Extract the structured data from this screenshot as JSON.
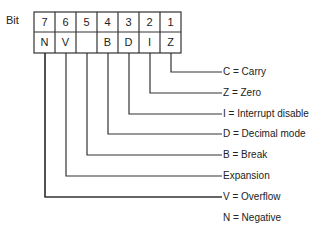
{
  "header": {
    "bit_label": "Bit"
  },
  "register": {
    "bit_numbers": [
      "7",
      "6",
      "5",
      "4",
      "3",
      "2",
      "1",
      "0"
    ],
    "flags": [
      "N",
      "V",
      "",
      "B",
      "D",
      "I",
      "Z",
      "C"
    ]
  },
  "legend": [
    {
      "bit": 0,
      "text": "C = Carry"
    },
    {
      "bit": 1,
      "text": "Z = Zero"
    },
    {
      "bit": 2,
      "text": "I = Interrupt disable"
    },
    {
      "bit": 3,
      "text": "D = Decimal mode"
    },
    {
      "bit": 4,
      "text": "B = Break"
    },
    {
      "bit": 5,
      "text": "Expansion"
    },
    {
      "bit": 6,
      "text": "V = Overflow"
    },
    {
      "bit": 7,
      "text": "N = Negative"
    }
  ],
  "colors": {
    "line": "#333333",
    "text": "#222222",
    "background": "#ffffff"
  }
}
